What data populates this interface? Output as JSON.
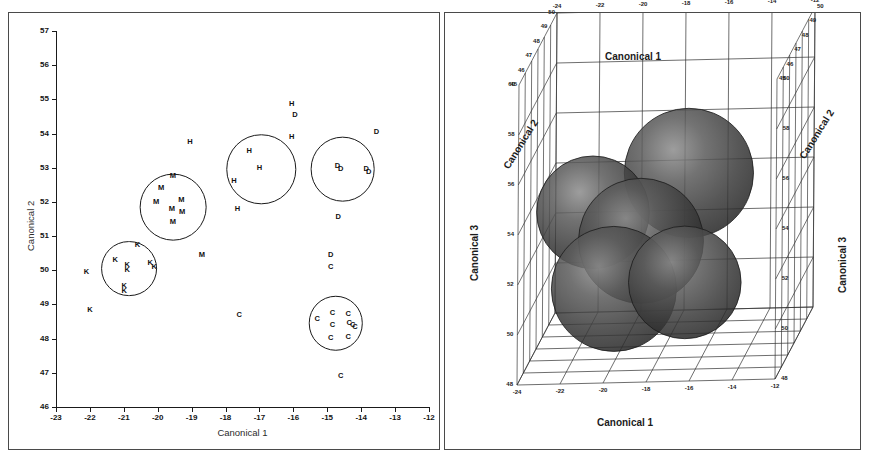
{
  "figure": {
    "panels": [
      "canonical-2d-scatter",
      "canonical-3d-spheres"
    ]
  },
  "chart_data": [
    {
      "id": "left",
      "type": "scatter",
      "title": "",
      "xlabel": "Canonical 1",
      "ylabel": "Canonical 2",
      "xlim": [
        -23,
        -12
      ],
      "ylim": [
        46,
        57
      ],
      "xticks": [
        "-23",
        "-22",
        "-21",
        "-20",
        "-19",
        "-18",
        "-17",
        "-16",
        "-15",
        "-14",
        "-13",
        "-12"
      ],
      "yticks": [
        "46",
        "47",
        "48",
        "49",
        "50",
        "51",
        "52",
        "53",
        "54",
        "55",
        "56",
        "57"
      ],
      "grid": false,
      "legend": "none",
      "point_label_note": "Each plotted marker is the letter code of its group",
      "groups": [
        {
          "code": "K",
          "name": "group-K",
          "circle": {
            "cx": -20.85,
            "cy": 50.05,
            "r": 0.82
          }
        },
        {
          "code": "M",
          "name": "group-M",
          "circle": {
            "cx": -19.55,
            "cy": 51.85,
            "r": 0.98
          }
        },
        {
          "code": "H",
          "name": "group-H",
          "circle": {
            "cx": -16.95,
            "cy": 52.95,
            "r": 1.02
          }
        },
        {
          "code": "D",
          "name": "group-D",
          "circle": {
            "cx": -14.55,
            "cy": 52.95,
            "r": 0.95
          }
        },
        {
          "code": "C",
          "name": "group-C",
          "circle": {
            "cx": -14.75,
            "cy": 48.45,
            "r": 0.8
          }
        }
      ],
      "points": [
        {
          "label": "K",
          "x": -22.1,
          "y": 49.95
        },
        {
          "label": "K",
          "x": -21.25,
          "y": 50.3
        },
        {
          "label": "K",
          "x": -20.9,
          "y": 50.15
        },
        {
          "label": "K",
          "x": -20.9,
          "y": 50.0
        },
        {
          "label": "K",
          "x": -20.99,
          "y": 49.55
        },
        {
          "label": "K",
          "x": -20.99,
          "y": 49.38
        },
        {
          "label": "K",
          "x": -20.6,
          "y": 50.75
        },
        {
          "label": "K",
          "x": -20.22,
          "y": 50.22
        },
        {
          "label": "K",
          "x": -20.1,
          "y": 50.1
        },
        {
          "label": "K",
          "x": -22.0,
          "y": 48.85
        },
        {
          "label": "M",
          "x": -19.55,
          "y": 52.75
        },
        {
          "label": "M",
          "x": -19.9,
          "y": 52.4
        },
        {
          "label": "M",
          "x": -20.05,
          "y": 52.0
        },
        {
          "label": "M",
          "x": -19.58,
          "y": 51.8
        },
        {
          "label": "M",
          "x": -19.3,
          "y": 52.05
        },
        {
          "label": "M",
          "x": -19.28,
          "y": 51.7
        },
        {
          "label": "M",
          "x": -19.55,
          "y": 51.4
        },
        {
          "label": "M",
          "x": -18.7,
          "y": 50.45
        },
        {
          "label": "H",
          "x": -19.05,
          "y": 53.75
        },
        {
          "label": "H",
          "x": -17.3,
          "y": 53.5
        },
        {
          "label": "H",
          "x": -17.0,
          "y": 53.0
        },
        {
          "label": "H",
          "x": -17.75,
          "y": 52.6
        },
        {
          "label": "H",
          "x": -17.65,
          "y": 51.8
        },
        {
          "label": "H",
          "x": -16.05,
          "y": 54.85
        },
        {
          "label": "H",
          "x": -16.05,
          "y": 53.9
        },
        {
          "label": "D",
          "x": -15.95,
          "y": 54.55
        },
        {
          "label": "D",
          "x": -13.55,
          "y": 54.05
        },
        {
          "label": "D",
          "x": -14.7,
          "y": 53.05
        },
        {
          "label": "D",
          "x": -14.6,
          "y": 52.95
        },
        {
          "label": "D",
          "x": -13.85,
          "y": 52.95
        },
        {
          "label": "D",
          "x": -13.78,
          "y": 52.88
        },
        {
          "label": "D",
          "x": -14.68,
          "y": 51.55
        },
        {
          "label": "D",
          "x": -14.9,
          "y": 50.45
        },
        {
          "label": "C",
          "x": -14.9,
          "y": 50.1
        },
        {
          "label": "C",
          "x": -14.85,
          "y": 48.75
        },
        {
          "label": "C",
          "x": -14.38,
          "y": 48.72
        },
        {
          "label": "C",
          "x": -14.85,
          "y": 48.4
        },
        {
          "label": "C",
          "x": -14.35,
          "y": 48.45
        },
        {
          "label": "C",
          "x": -14.25,
          "y": 48.4
        },
        {
          "label": "C",
          "x": -14.18,
          "y": 48.35
        },
        {
          "label": "C",
          "x": -14.9,
          "y": 48.03
        },
        {
          "label": "C",
          "x": -14.38,
          "y": 48.05
        },
        {
          "label": "C",
          "x": -15.3,
          "y": 48.58
        },
        {
          "label": "C",
          "x": -17.6,
          "y": 48.7
        },
        {
          "label": "C",
          "x": -14.6,
          "y": 46.9
        }
      ]
    },
    {
      "id": "right",
      "type": "scatter3d",
      "title": "",
      "xlabel_top": "Canonical 1",
      "xlabel_bottom": "Canonical 1",
      "ylabel": "Canonical 2",
      "zlabel_left": "Canonical 3",
      "zlabel_right": "Canonical 3",
      "xticks": [
        "-24",
        "-22",
        "-20",
        "-18",
        "-16",
        "-14",
        "-12"
      ],
      "zticks": [
        "48",
        "50",
        "52",
        "54",
        "56",
        "58",
        "60"
      ],
      "yticks": [
        "45",
        "46",
        "47",
        "48",
        "49",
        "50"
      ],
      "grid": true,
      "legend": "none",
      "spheres": [
        {
          "name": "sphere-upper-right",
          "cx": 0.585,
          "cy": 0.365,
          "r": 0.155,
          "shade": "dark"
        },
        {
          "name": "sphere-upper-left",
          "cx": 0.355,
          "cy": 0.455,
          "r": 0.135,
          "shade": "dark"
        },
        {
          "name": "sphere-center",
          "cx": 0.47,
          "cy": 0.52,
          "r": 0.15,
          "shade": "dark"
        },
        {
          "name": "sphere-lower-left",
          "cx": 0.405,
          "cy": 0.63,
          "r": 0.15,
          "shade": "dark"
        },
        {
          "name": "sphere-lower-right",
          "cx": 0.575,
          "cy": 0.615,
          "r": 0.135,
          "shade": "dark"
        }
      ]
    }
  ],
  "style": {
    "axis_color": "#1a1a1a",
    "grid_color": "#3a3a3a",
    "sphere_color": "#3b3b3b",
    "background": "#ffffff"
  }
}
